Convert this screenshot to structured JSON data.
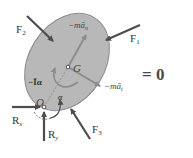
{
  "diagram": {
    "type": "kinetic free-body diagram",
    "body": {
      "shape": "ellipse",
      "fill": "#b8b8b8",
      "stroke": "#8a8a8a"
    },
    "points": {
      "center_of_mass": {
        "label": "G"
      },
      "pivot": {
        "label": "O"
      }
    },
    "forces": {
      "f1": {
        "label": "F",
        "sub": "1"
      },
      "f2": {
        "label": "F",
        "sub": "2"
      },
      "f3": {
        "label": "F",
        "sub": "3"
      },
      "rx": {
        "label": "R",
        "sub": "x"
      },
      "ry": {
        "label": "R",
        "sub": "y"
      }
    },
    "inertial_terms": {
      "normal": {
        "label": "−mā",
        "sub": "n"
      },
      "tangential": {
        "label": "−mā",
        "sub": "t"
      },
      "couple": {
        "label": "−Īα"
      }
    },
    "angular_accel": {
      "label": "α"
    },
    "equation_rhs": "= 0",
    "colors": {
      "force_arrow": "#4d4d4d",
      "inertial_arrow": "#8c8c8c",
      "body_fill": "#b8b8b8",
      "text": "#333333"
    }
  }
}
